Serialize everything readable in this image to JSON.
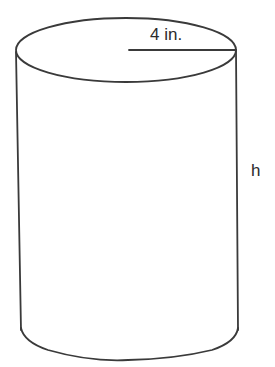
{
  "figure": {
    "shape": "cylinder",
    "radius_label": "4 in.",
    "height_label": "h",
    "stroke_color": "#3a3a3a",
    "background": "#ffffff"
  }
}
